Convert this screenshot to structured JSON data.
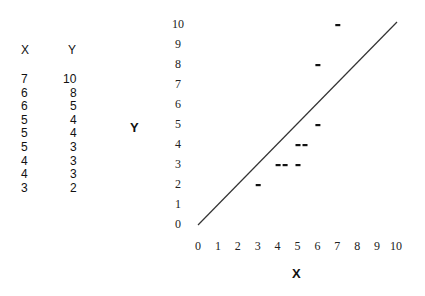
{
  "table": {
    "headers": [
      "X",
      "Y"
    ],
    "rows": [
      [
        "7",
        "10"
      ],
      [
        "6",
        "8"
      ],
      [
        "6",
        "5"
      ],
      [
        "5",
        "4"
      ],
      [
        "5",
        "4"
      ],
      [
        "5",
        "3"
      ],
      [
        "4",
        "3"
      ],
      [
        "4",
        "3"
      ],
      [
        "3",
        "2"
      ]
    ]
  },
  "chart_data": {
    "type": "scatter",
    "title": "",
    "xlabel": "X",
    "ylabel": "Y",
    "xlim": [
      0,
      10
    ],
    "ylim": [
      0,
      10
    ],
    "x_ticks": [
      "0",
      "1",
      "2",
      "3",
      "4",
      "5",
      "6",
      "7",
      "8",
      "9",
      "10"
    ],
    "y_ticks": [
      "0",
      "1",
      "2",
      "3",
      "4",
      "5",
      "6",
      "7",
      "8",
      "9",
      "10"
    ],
    "grid": false,
    "marker": "dash",
    "series": [
      {
        "name": "points",
        "x": [
          7,
          6,
          6,
          5,
          5,
          5,
          4,
          4,
          3
        ],
        "y": [
          10,
          8,
          5,
          4,
          4,
          3,
          3,
          3,
          2
        ]
      }
    ],
    "reference_line": {
      "label": "y = x",
      "from": [
        0,
        0
      ],
      "to": [
        10,
        10
      ]
    }
  }
}
